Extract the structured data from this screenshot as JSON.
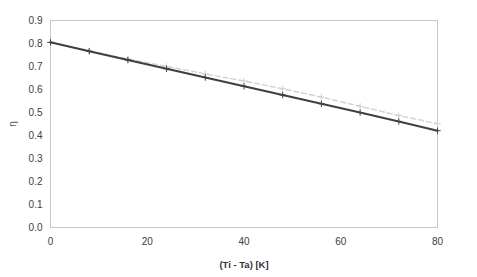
{
  "chart_data": {
    "type": "line",
    "title": "",
    "subtitle": "",
    "xlabel": "(Ti - Ta) [K]",
    "ylabel": "η",
    "xlim": [
      0,
      80
    ],
    "ylim": [
      0.0,
      0.9
    ],
    "xticks": [
      0,
      20,
      40,
      60,
      80
    ],
    "xtick_labels": [
      "0",
      "20",
      "40",
      "60",
      "80"
    ],
    "yticks": [
      0.0,
      0.1,
      0.2,
      0.3,
      0.4,
      0.5,
      0.6,
      0.7,
      0.8,
      0.9
    ],
    "ytick_labels": [
      "0.0",
      "0.1",
      "0.2",
      "0.3",
      "0.4",
      "0.5",
      "0.6",
      "0.7",
      "0.8",
      "0.9"
    ],
    "grid": false,
    "legend": "none",
    "x": [
      0,
      8,
      16,
      24,
      32,
      40,
      48,
      56,
      64,
      72,
      80
    ],
    "series": [
      {
        "name": "series-dark",
        "style": "solid",
        "color": "#3f3f3f",
        "marker": "plus",
        "values": [
          0.805,
          0.766,
          0.728,
          0.69,
          0.652,
          0.614,
          0.576,
          0.538,
          0.5,
          0.461,
          0.421
        ]
      },
      {
        "name": "series-light",
        "style": "dashed",
        "color": "#d2d2d2",
        "marker": "plus",
        "values": [
          0.805,
          0.768,
          0.733,
          0.7,
          0.668,
          0.637,
          0.603,
          0.567,
          0.527,
          0.487,
          0.451
        ]
      }
    ]
  },
  "axes": {
    "x_title": "(Ti - Ta) [K]",
    "y_title": "η"
  },
  "colors": {
    "background": "#ffffff",
    "frame": "#c8c8c8",
    "tick_text": "#404040",
    "series_dark": "#3f3f3f",
    "series_light": "#d2d2d2"
  }
}
